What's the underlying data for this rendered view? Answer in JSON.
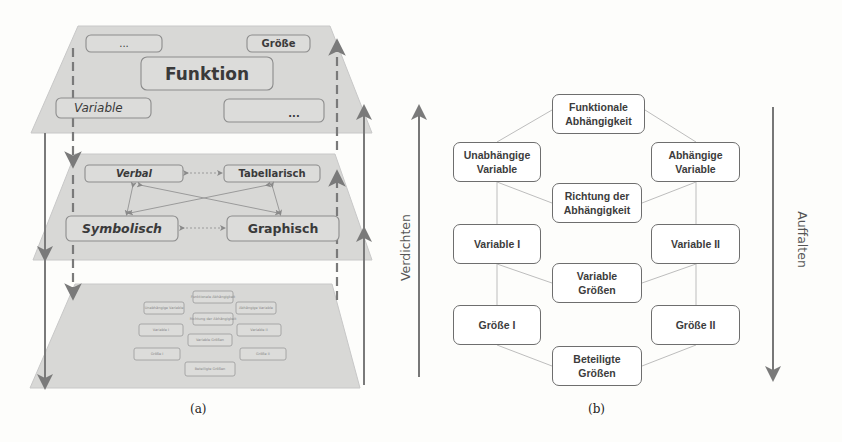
{
  "figure_a": {
    "caption": "(a)",
    "top_layer": {
      "boxes": [
        {
          "id": "ellipsis-top-left",
          "label": "..."
        },
        {
          "id": "groesse",
          "label": "Größe"
        },
        {
          "id": "funktion",
          "label": "Funktion"
        },
        {
          "id": "variable",
          "label": "Variable"
        },
        {
          "id": "ellipsis-bottom-right",
          "label": "..."
        }
      ]
    },
    "middle_layer": {
      "boxes": [
        {
          "id": "verbal",
          "label": "Verbal"
        },
        {
          "id": "tabellarisch",
          "label": "Tabellarisch"
        },
        {
          "id": "symbolisch",
          "label": "Symbolisch"
        },
        {
          "id": "graphisch",
          "label": "Graphisch"
        }
      ]
    },
    "bottom_layer": {
      "boxes": [
        {
          "label": "Funktionale Abhängigkeit"
        },
        {
          "label": "Unabhängige Variable"
        },
        {
          "label": "Abhängige Variable"
        },
        {
          "label": "Richtung der Abhängigkeit"
        },
        {
          "label": "Variable I"
        },
        {
          "label": "Variable II"
        },
        {
          "label": "Variable Größen"
        },
        {
          "label": "Größe I"
        },
        {
          "label": "Größe II"
        },
        {
          "label": "Beteiligte Größen"
        }
      ]
    },
    "colors": {
      "layer_fill": "#d6d6d4",
      "box_border": "#8c8c8c",
      "arrow": "#7a7a7a"
    }
  },
  "figure_b": {
    "caption": "(b)",
    "left_arrow_label": "Verdichten",
    "right_arrow_label": "Auffalten",
    "nodes": {
      "funktionale": {
        "line1": "Funktionale",
        "line2": "Abhängigkeit"
      },
      "unabhaengige": {
        "line1": "Unabhängige",
        "line2": "Variable"
      },
      "abhaengige": {
        "line1": "Abhängige",
        "line2": "Variable"
      },
      "richtung": {
        "line1": "Richtung der",
        "line2": "Abhängigkeit"
      },
      "variable1": {
        "line1": "Variable I"
      },
      "variable2": {
        "line1": "Variable II"
      },
      "variable_groessen": {
        "line1": "Variable",
        "line2": "Größen"
      },
      "groesse1": {
        "line1": "Größe I"
      },
      "groesse2": {
        "line1": "Größe II"
      },
      "beteiligte": {
        "line1": "Beteiligte",
        "line2": "Größen"
      }
    },
    "colors": {
      "box_border": "#6e6e6e",
      "connector": "#b8b8b8",
      "arrow": "#777777"
    }
  }
}
